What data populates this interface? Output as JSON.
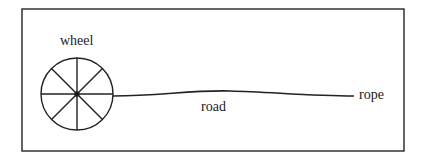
{
  "diagram": {
    "labels": {
      "wheel": "wheel",
      "road": "road",
      "rope": "rope"
    },
    "colors": {
      "stroke": "#222222",
      "background": "#ffffff"
    }
  }
}
